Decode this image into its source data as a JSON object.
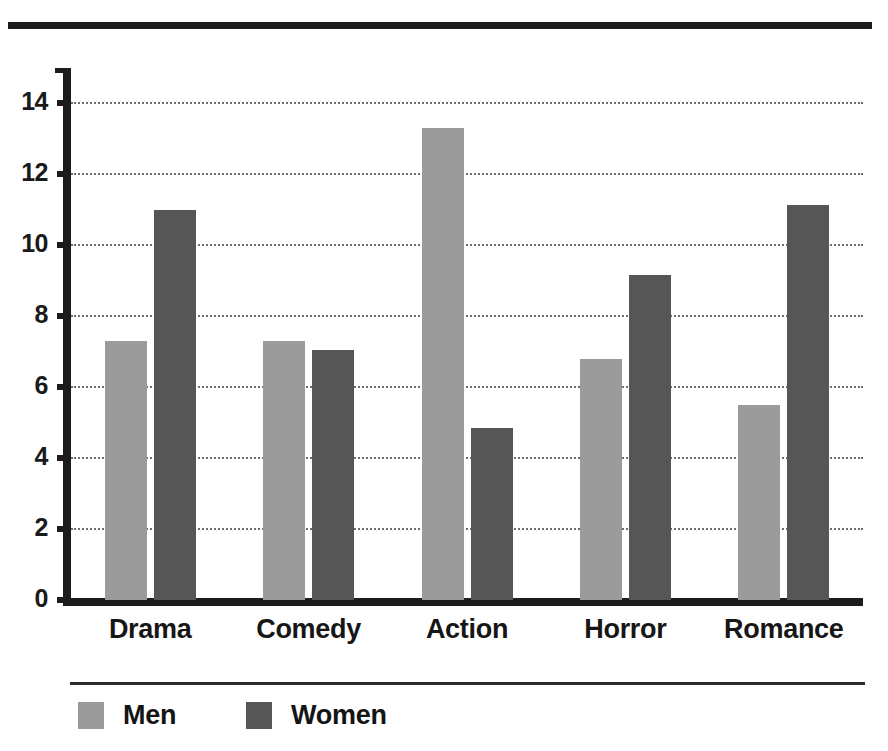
{
  "chart_data": {
    "type": "bar",
    "title": "",
    "subtitle": "",
    "xlabel": "",
    "ylabel": "",
    "categories": [
      "Drama",
      "Comedy",
      "Action",
      "Horror",
      "Romance"
    ],
    "series": [
      {
        "name": "Men",
        "color": "#9b9b9b",
        "values": [
          7.3,
          7.3,
          13.3,
          6.8,
          5.5
        ]
      },
      {
        "name": "Women",
        "color": "#565656",
        "values": [
          11.0,
          7.05,
          4.85,
          9.15,
          11.15
        ]
      }
    ],
    "ylim": [
      0,
      15
    ],
    "yticks": [
      0,
      2,
      4,
      6,
      8,
      10,
      12,
      14
    ],
    "ytick_labels": [
      "0",
      "2",
      "4",
      "6",
      "8",
      "10",
      "12",
      "14"
    ],
    "grid": "horizontal-dotted",
    "legend_position": "bottom-left",
    "bar_orientation": "vertical",
    "grouped": true
  },
  "axis": {
    "y_labels": [
      "14",
      "12",
      "10",
      "8",
      "6",
      "4",
      "2",
      "0"
    ],
    "x_labels": [
      "Drama",
      "Comedy",
      "Action",
      "Horror",
      "Romance"
    ]
  },
  "legend": {
    "items": [
      {
        "label": "Men",
        "color": "#9b9b9b"
      },
      {
        "label": "Women",
        "color": "#565656"
      }
    ]
  }
}
